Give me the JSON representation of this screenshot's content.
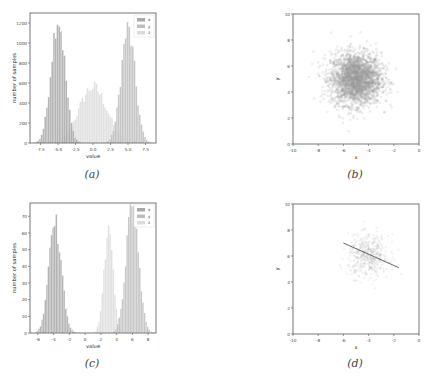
{
  "chart_data": [
    {
      "id": "a",
      "type": "bar",
      "subtype": "histogram",
      "caption": "(a)",
      "xlabel": "value",
      "ylabel": "number of samples",
      "xlim": [
        -9,
        9
      ],
      "ylim": [
        0,
        1300
      ],
      "xticks": [
        -7.5,
        -5.0,
        -2.5,
        0.0,
        2.5,
        5.0,
        7.5
      ],
      "xtick_labels": [
        "-7.5",
        "-5.0",
        "-2.5",
        "0.0",
        "2.5",
        "5.0",
        "7.5"
      ],
      "yticks": [
        0,
        200,
        400,
        600,
        800,
        1000,
        1200
      ],
      "legend": [
        "x",
        "y",
        "z"
      ],
      "legend_position": "upper right",
      "series": [
        {
          "name": "x",
          "color": "#a8a8a8",
          "center": -5.0,
          "std": 1.0,
          "peak": 1250
        },
        {
          "name": "y",
          "color": "#bdbdbd",
          "center": 5.0,
          "std": 1.0,
          "peak": 1130
        },
        {
          "name": "z",
          "color": "#dcdcdc",
          "center": 0.0,
          "std": 2.0,
          "peak": 560
        }
      ]
    },
    {
      "id": "b",
      "type": "scatter",
      "caption": "(b)",
      "xlabel": "x",
      "ylabel": "y",
      "xlim": [
        -10,
        0
      ],
      "ylim": [
        0,
        10
      ],
      "xticks": [
        -10,
        -8,
        -6,
        -4,
        -2,
        0
      ],
      "yticks": [
        0,
        2,
        4,
        6,
        8,
        10
      ],
      "cluster": {
        "center": [
          -5,
          5
        ],
        "std": 1.0,
        "color": "#9a9a9a"
      }
    },
    {
      "id": "c",
      "type": "bar",
      "subtype": "histogram",
      "caption": "(c)",
      "xlabel": "value",
      "ylabel": "number of samples",
      "xlim": [
        -7,
        9
      ],
      "ylim": [
        0,
        78
      ],
      "xticks": [
        -6,
        -4,
        -2,
        0,
        2,
        4,
        6,
        8
      ],
      "xtick_labels": [
        "-6",
        "-4",
        "-2",
        "0",
        "2",
        "4",
        "6",
        "8"
      ],
      "yticks": [
        0,
        10,
        20,
        30,
        40,
        50,
        60,
        70
      ],
      "legend": [
        "x",
        "y",
        "z"
      ],
      "legend_position": "upper right",
      "series": [
        {
          "name": "x",
          "color": "#a8a8a8",
          "center": -3.8,
          "std": 0.8,
          "peak": 65
        },
        {
          "name": "y",
          "color": "#bdbdbd",
          "center": 6.0,
          "std": 0.8,
          "peak": 75
        },
        {
          "name": "z",
          "color": "#dcdcdc",
          "center": 3.0,
          "std": 0.6,
          "peak": 60
        }
      ]
    },
    {
      "id": "d",
      "type": "scatter",
      "caption": "(d)",
      "xlabel": "x",
      "ylabel": "y",
      "xlim": [
        -10,
        0
      ],
      "ylim": [
        0,
        10
      ],
      "xticks": [
        -10,
        -8,
        -6,
        -4,
        -2,
        0
      ],
      "yticks": [
        0,
        2,
        4,
        6,
        8,
        10
      ],
      "cluster": {
        "center": [
          -4,
          6
        ],
        "std": 0.8,
        "color": "#b0b0b0"
      },
      "line": {
        "x": [
          -6.0,
          -1.6
        ],
        "y": [
          7.0,
          5.1
        ],
        "color": "#555555"
      }
    }
  ],
  "captions": {
    "a": "(a)",
    "b": "(b)",
    "c": "(c)",
    "d": "(d)"
  }
}
